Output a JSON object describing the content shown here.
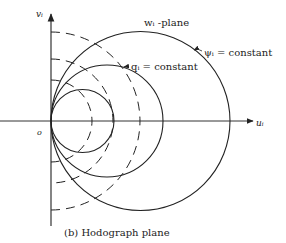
{
  "figure": {
    "caption": "(b) Hodograph plane",
    "plane_label": "wᵢ -plane",
    "axes": {
      "horizontal_label": "uᵢ",
      "vertical_label": "vᵢ",
      "origin_label": "o"
    },
    "annotations": {
      "psi_label": "ψᵢ = constant",
      "q_label": "qᵢ = constant"
    },
    "curves": {
      "solid_circles_note": "ψᵢ = constant (circles through origin, centered on u-axis)",
      "dashed_arcs_note": "qᵢ = constant (circles centered at origin)"
    }
  }
}
